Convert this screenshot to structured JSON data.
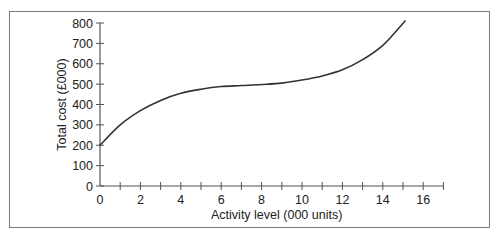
{
  "chart_data": {
    "type": "line",
    "title": "",
    "xlabel": "Activity level (000 units)",
    "ylabel": "Total cost (£000)",
    "xlim": [
      0,
      17
    ],
    "ylim": [
      0,
      800
    ],
    "x_ticks": [
      0,
      2,
      4,
      6,
      8,
      10,
      12,
      14,
      16
    ],
    "x_minor_ticks": [
      1,
      3,
      5,
      7,
      9,
      11,
      13,
      15
    ],
    "y_ticks": [
      0,
      100,
      200,
      300,
      400,
      500,
      600,
      700,
      800
    ],
    "grid": false,
    "legend": null,
    "series": [
      {
        "name": "Total cost",
        "x": [
          0,
          1,
          2,
          3,
          4,
          5,
          6,
          7,
          8,
          9,
          10,
          11,
          12,
          13,
          14,
          15.1
        ],
        "y": [
          200,
          300,
          370,
          420,
          455,
          475,
          488,
          493,
          498,
          505,
          520,
          540,
          570,
          620,
          690,
          810
        ]
      }
    ]
  },
  "colors": {
    "curve": "#333333",
    "axis": "#555555",
    "frame": "#7a7a7a",
    "text": "#222222"
  }
}
